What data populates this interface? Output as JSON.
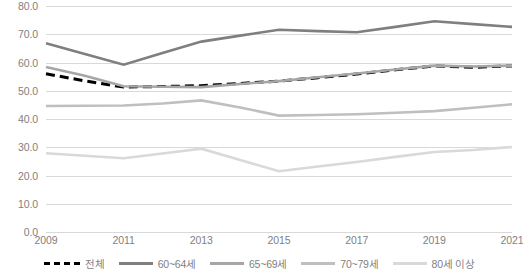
{
  "chart_data": {
    "type": "line",
    "title": "",
    "subtitle": "",
    "xlabel": "",
    "ylabel": "",
    "x": [
      2009,
      2010,
      2011,
      2012,
      2013,
      2014,
      2015,
      2016,
      2017,
      2018,
      2019,
      2020,
      2021
    ],
    "xtick_labels": [
      "2009",
      "2011",
      "2013",
      "2015",
      "2017",
      "2019",
      "2021"
    ],
    "xticks": [
      2009,
      2011,
      2013,
      2015,
      2017,
      2019,
      2021
    ],
    "ytick_labels": [
      "0.0",
      "10.0",
      "20.0",
      "30.0",
      "40.0",
      "50.0",
      "60.0",
      "70.0",
      "80.0"
    ],
    "yticks": [
      0,
      10,
      20,
      30,
      40,
      50,
      60,
      70,
      80
    ],
    "ylim": [
      0,
      80
    ],
    "xlim": [
      2009,
      2021
    ],
    "grid": true,
    "legend_position": "bottom",
    "series": [
      {
        "name": "전체",
        "color": "#000000",
        "style": "dashed",
        "width": 3,
        "values": [
          56.0,
          53.5,
          51.3,
          51.5,
          51.8,
          52.6,
          53.4,
          54.6,
          55.9,
          57.4,
          58.8,
          58.3,
          58.8
        ]
      },
      {
        "name": "60~64세",
        "color": "#7f7f7f",
        "style": "solid",
        "width": 2.6,
        "values": [
          66.8,
          63.0,
          59.2,
          63.4,
          67.4,
          69.5,
          71.6,
          71.1,
          70.7,
          72.6,
          74.6,
          73.6,
          72.6
        ]
      },
      {
        "name": "65~69세",
        "color": "#a6a6a6",
        "style": "solid",
        "width": 2.6,
        "values": [
          58.4,
          55.3,
          51.6,
          51.4,
          51.3,
          52.4,
          53.4,
          54.8,
          56.1,
          57.5,
          58.9,
          58.6,
          58.9
        ]
      },
      {
        "name": "70~79세",
        "color": "#bfbfbf",
        "style": "solid",
        "width": 2.6,
        "values": [
          44.6,
          44.7,
          44.8,
          45.5,
          46.6,
          44.1,
          41.2,
          41.4,
          41.7,
          42.2,
          42.8,
          44.0,
          45.2
        ]
      },
      {
        "name": "80세 이상",
        "color": "#d9d9d9",
        "style": "solid",
        "width": 2.6,
        "values": [
          27.9,
          27.0,
          26.1,
          27.8,
          29.5,
          25.5,
          21.5,
          23.2,
          24.8,
          26.6,
          28.3,
          29.0,
          30.1
        ]
      }
    ]
  },
  "legend": {
    "items": [
      {
        "label": "전체",
        "color": "#000000",
        "style": "dashed",
        "name": "legend-item-total"
      },
      {
        "label": "60~64세",
        "color": "#7f7f7f",
        "style": "solid",
        "name": "legend-item-60-64"
      },
      {
        "label": "65~69세",
        "color": "#a6a6a6",
        "style": "solid",
        "name": "legend-item-65-69"
      },
      {
        "label": "70~79세",
        "color": "#bfbfbf",
        "style": "solid",
        "name": "legend-item-70-79"
      },
      {
        "label": "80세 이상",
        "color": "#d9d9d9",
        "style": "solid",
        "name": "legend-item-80-plus"
      }
    ]
  },
  "axes": {
    "gridline_color": "#d9d9d9",
    "tick_text_color": "#7f7f7f"
  }
}
